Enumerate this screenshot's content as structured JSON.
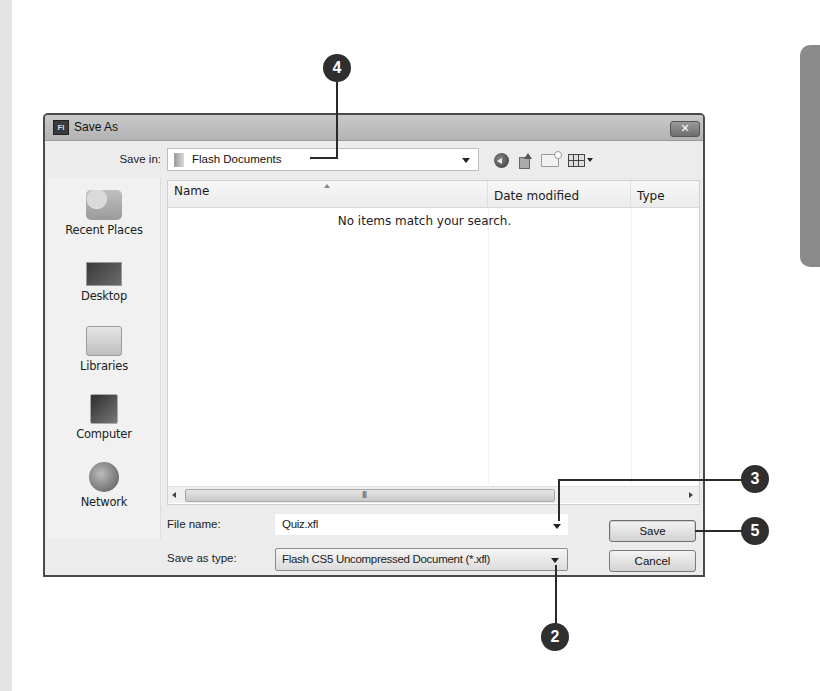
{
  "dialog": {
    "title": "Save As",
    "app_icon": "Fl",
    "close_glyph": "✕"
  },
  "save_in": {
    "label": "Save in:",
    "value": "Flash Documents",
    "icon": "folder-icon"
  },
  "toolbar": {
    "icons": [
      "back-icon",
      "up-folder-icon",
      "new-folder-icon",
      "views-menu-icon"
    ]
  },
  "sidebar": {
    "items": [
      {
        "label": "Recent Places",
        "icon": "recent-places-icon"
      },
      {
        "label": "Desktop",
        "icon": "desktop-icon"
      },
      {
        "label": "Libraries",
        "icon": "libraries-icon"
      },
      {
        "label": "Computer",
        "icon": "computer-icon"
      },
      {
        "label": "Network",
        "icon": "network-icon"
      }
    ]
  },
  "list": {
    "columns": [
      "Name",
      "Date modified",
      "Type"
    ],
    "empty_message": "No items match your search.",
    "scroll_grip": "III"
  },
  "file_name": {
    "label": "File name:",
    "value": "Quiz.xfl"
  },
  "save_as_type": {
    "label": "Save as type:",
    "value": "Flash CS5 Uncompressed Document (*.xfl)"
  },
  "buttons": {
    "save": "Save",
    "cancel": "Cancel"
  },
  "callouts": [
    {
      "number": "4",
      "target": "save-in-combo"
    },
    {
      "number": "3",
      "target": "file-name-input"
    },
    {
      "number": "5",
      "target": "save-button"
    },
    {
      "number": "2",
      "target": "save-as-type-combo"
    }
  ]
}
